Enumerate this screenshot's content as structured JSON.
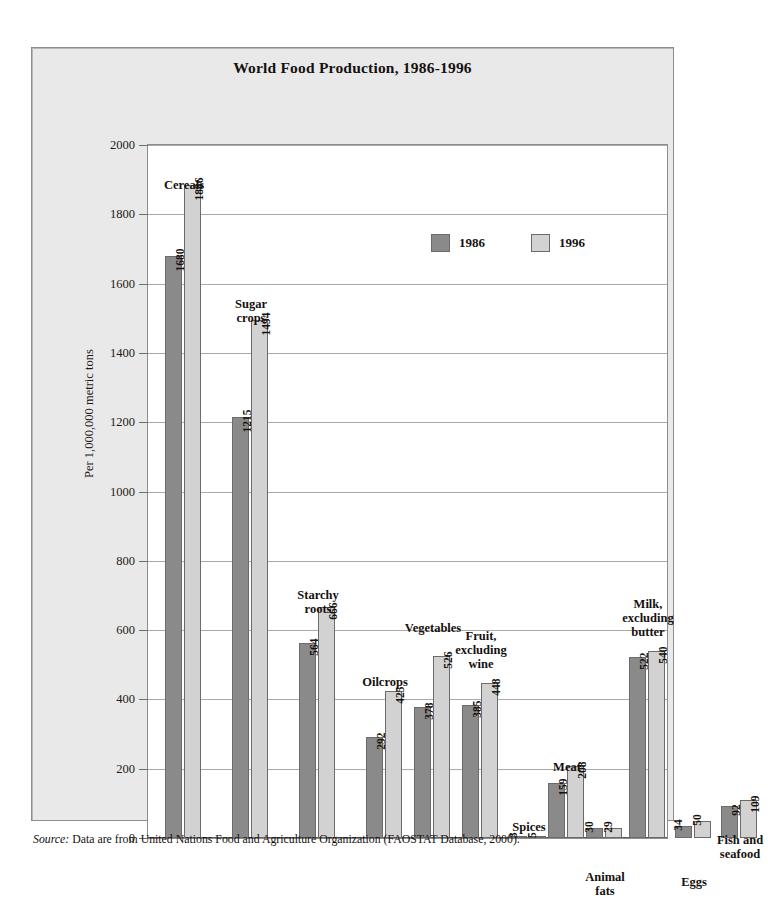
{
  "chart_data": {
    "type": "bar",
    "title": "World Food Production, 1986-1996",
    "xlabel": "",
    "ylabel": "Per 1,000,000 metric tons",
    "ylim": [
      0,
      2000
    ],
    "ytick_step": 200,
    "yticks": [
      "2000",
      "1800",
      "1600",
      "1400",
      "1200",
      "1000",
      "800",
      "600",
      "400",
      "200",
      "0"
    ],
    "grid": true,
    "legend_position": "upper-right-inside",
    "categories": [
      "Cereals",
      "Sugar\ncrops",
      "Starchy\nroots",
      "Oilcrops",
      "Vegetables",
      "Fruit,\nexcluding\nwine",
      "Spices",
      "Meat",
      "Animal\nfats",
      "Milk,\nexcluding\nbutter",
      "Eggs",
      "Fish and\nseafood"
    ],
    "series": [
      {
        "name": "1986",
        "color": "#8a8a8a",
        "values": [
          1680,
          1215,
          564,
          292,
          378,
          385,
          3,
          159,
          30,
          522,
          34,
          92
        ]
      },
      {
        "name": "1996",
        "color": "#d2d2d2",
        "values": [
          1886,
          1494,
          666,
          425,
          526,
          448,
          5,
          208,
          29,
          540,
          50,
          109
        ]
      }
    ]
  },
  "source": {
    "prefix": "Source:",
    "text": " Data are from United Nations Food and Agriculture Organization (FAOSTAT Database, 2000)."
  }
}
